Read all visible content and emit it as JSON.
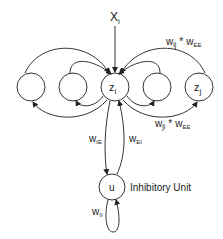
{
  "diagram": {
    "input_label": "X",
    "input_sub": "i",
    "center_node": {
      "label": "z",
      "sub": "i"
    },
    "right_node": {
      "label": "z",
      "sub": "j"
    },
    "inhibitory_node": {
      "label": "u"
    },
    "inhibitory_caption": "Inhibitory Unit",
    "weights": {
      "wij_wee": {
        "w": "w",
        "wsub": "ij",
        "star": "*",
        "e": "w",
        "esub": "EE"
      },
      "wji_wee": {
        "w": "w",
        "wsub": "ji",
        "star": "*",
        "e": "w",
        "esub": "EE"
      },
      "wie": {
        "w": "w",
        "sub": "IE"
      },
      "wei": {
        "w": "w",
        "sub": "EI"
      },
      "wii": {
        "w": "w",
        "sub": "II"
      }
    }
  }
}
